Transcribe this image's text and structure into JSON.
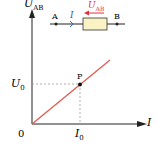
{
  "diagram": {
    "y_axis_label": "U",
    "y_axis_sub": "AB",
    "x_axis_label": "I",
    "origin_label": "0",
    "u0_label": "U",
    "u0_sub": "0",
    "i0_label": "I",
    "i0_sub": "0",
    "point_label": "P",
    "circuit": {
      "node_a": "A",
      "node_b": "B",
      "current_label": "I",
      "voltage_label": "U",
      "voltage_sub": "AB"
    },
    "colors": {
      "line": "#e05a4f",
      "voltage_arrow": "#e0303a",
      "current": "#3060c0",
      "resistor_fill": "#f8f2c4",
      "axis": "#222222",
      "dashed": "#999999"
    }
  }
}
